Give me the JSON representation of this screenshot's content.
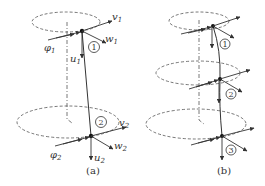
{
  "figure": {
    "panels": [
      {
        "id": "a",
        "caption": "(a)",
        "nodes": [
          {
            "number": "1",
            "labels": {
              "v": "v",
              "v_sub": "1",
              "w": "w",
              "w_sub": "1",
              "u": "u",
              "u_sub": "1",
              "phi": "φ",
              "phi_sub": "1"
            }
          },
          {
            "number": "2",
            "labels": {
              "v": "v",
              "v_sub": "2",
              "w": "w",
              "w_sub": "2",
              "u": "u",
              "u_sub": "2",
              "phi": "φ",
              "phi_sub": "2"
            }
          }
        ]
      },
      {
        "id": "b",
        "caption": "(b)",
        "nodes": [
          {
            "number": "1"
          },
          {
            "number": "2"
          },
          {
            "number": "3"
          }
        ]
      }
    ],
    "colors": {
      "line": "#333333",
      "dashed": "#555555",
      "background": "#ffffff"
    }
  }
}
